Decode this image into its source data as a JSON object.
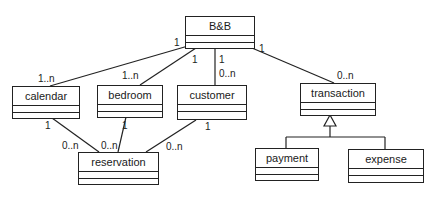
{
  "diagram": {
    "type": "UML class diagram",
    "classes": {
      "bnb": "B&B",
      "calendar": "calendar",
      "bedroom": "bedroom",
      "customer": "customer",
      "transaction": "transaction",
      "reservation": "reservation",
      "payment": "payment",
      "expense": "expense"
    },
    "associations": [
      {
        "from": "B&B",
        "to": "calendar",
        "from_mult": "1",
        "to_mult": "1..n"
      },
      {
        "from": "B&B",
        "to": "bedroom",
        "from_mult": "1",
        "to_mult": "1..n"
      },
      {
        "from": "B&B",
        "to": "customer",
        "from_mult": "1",
        "to_mult": "0..n"
      },
      {
        "from": "B&B",
        "to": "transaction",
        "from_mult": "1",
        "to_mult": "0..n"
      },
      {
        "from": "calendar",
        "to": "reservation",
        "from_mult": "1",
        "to_mult": "0..n"
      },
      {
        "from": "bedroom",
        "to": "reservation",
        "from_mult": "1",
        "to_mult": "0..n"
      },
      {
        "from": "customer",
        "to": "reservation",
        "from_mult": "1",
        "to_mult": "0..n"
      }
    ],
    "generalizations": [
      {
        "parent": "transaction",
        "children": [
          "payment",
          "expense"
        ]
      }
    ],
    "labels": {
      "bnb_calendar_src": "1",
      "bnb_calendar_dst": "1..n",
      "bnb_bedroom_src": "1",
      "bnb_bedroom_dst": "1..n",
      "bnb_customer_src": "1",
      "bnb_customer_dst": "0..n",
      "bnb_transaction_src": "1",
      "bnb_transaction_dst": "0..n",
      "calendar_res_src": "1",
      "calendar_res_dst": "0..n",
      "bedroom_res_src": "1",
      "bedroom_res_dst": "0..n",
      "customer_res_src": "1",
      "customer_res_dst": "0..n"
    }
  }
}
